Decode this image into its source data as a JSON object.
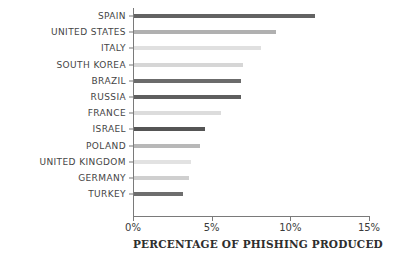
{
  "chart_data": {
    "type": "bar",
    "orientation": "horizontal",
    "title": "",
    "xlabel": "PERCENTAGE OF PHISHING PRODUCED",
    "ylabel": "",
    "xlim": [
      0,
      15
    ],
    "ylim": null,
    "grid": false,
    "legend": null,
    "xtick_labels": [
      "0%",
      "5%",
      "10%",
      "15%"
    ],
    "xtick_values": [
      0,
      5,
      10,
      15
    ],
    "categories": [
      "SPAIN",
      "UNITED STATES",
      "ITALY",
      "SOUTH KOREA",
      "BRAZIL",
      "RUSSIA",
      "FRANCE",
      "ISRAEL",
      "POLAND",
      "UNITED KINGDOM",
      "GERMANY",
      "TURKEY"
    ],
    "values": [
      11.5,
      9.0,
      8.1,
      6.9,
      6.8,
      6.8,
      5.5,
      4.5,
      4.2,
      3.6,
      3.5,
      3.1
    ],
    "bar_colors": [
      "#636363",
      "#b0b0b0",
      "#e0e0e0",
      "#d6d6d6",
      "#6b6b6b",
      "#5f5f5f",
      "#dcdcdc",
      "#555555",
      "#b8b8b8",
      "#e2e2e2",
      "#cfcfcf",
      "#6e6e6e"
    ],
    "bars": [
      {
        "label": "SPAIN",
        "value": 11.5,
        "color": "#636363"
      },
      {
        "label": "UNITED STATES",
        "value": 9.0,
        "color": "#b0b0b0"
      },
      {
        "label": "ITALY",
        "value": 8.1,
        "color": "#e0e0e0"
      },
      {
        "label": "SOUTH KOREA",
        "value": 6.9,
        "color": "#d6d6d6"
      },
      {
        "label": "BRAZIL",
        "value": 6.8,
        "color": "#6b6b6b"
      },
      {
        "label": "RUSSIA",
        "value": 6.8,
        "color": "#5f5f5f"
      },
      {
        "label": "FRANCE",
        "value": 5.5,
        "color": "#dcdcdc"
      },
      {
        "label": "ISRAEL",
        "value": 4.5,
        "color": "#555555"
      },
      {
        "label": "POLAND",
        "value": 4.2,
        "color": "#b8b8b8"
      },
      {
        "label": "UNITED KINGDOM",
        "value": 3.6,
        "color": "#e2e2e2"
      },
      {
        "label": "GERMANY",
        "value": 3.5,
        "color": "#cfcfcf"
      },
      {
        "label": "TURKEY",
        "value": 3.1,
        "color": "#6e6e6e"
      }
    ],
    "axis_color": "#7a7a7a",
    "background_color": "#ffffff"
  }
}
